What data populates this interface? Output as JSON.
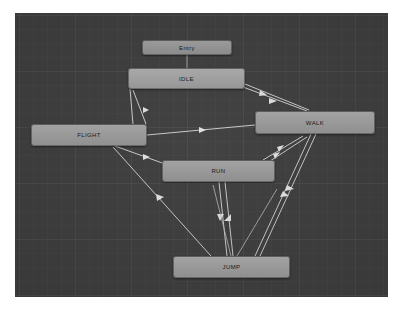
{
  "window": {
    "title": "Animator",
    "canvas_background_color": "#3f3f3f",
    "grid_color": "#4a4a4a"
  },
  "graph": {
    "type": "state-machine",
    "node_fill_color": "#9b9b9b",
    "transition_color": "#d8d8d8",
    "nodes": [
      {
        "id": "entry",
        "label": "Entry",
        "kind": "entry",
        "x": 127,
        "y": 27,
        "width": 90,
        "height": 15
      },
      {
        "id": "idle",
        "label": "IDLE",
        "kind": "default",
        "x": 113,
        "y": 55,
        "width": 117,
        "height": 21
      },
      {
        "id": "flight",
        "label": "FLIGHT",
        "kind": "state",
        "x": 16,
        "y": 111,
        "width": 116,
        "height": 22
      },
      {
        "id": "walk",
        "label": "WALK",
        "kind": "state",
        "x": 240,
        "y": 98,
        "width": 120,
        "height": 23
      },
      {
        "id": "run",
        "label": "RUN",
        "kind": "state",
        "x": 147,
        "y": 147,
        "width": 113,
        "height": 22
      },
      {
        "id": "jump",
        "label": "JUMP",
        "kind": "state",
        "x": 158,
        "y": 243,
        "width": 117,
        "height": 22
      }
    ],
    "transitions": [
      {
        "from": "entry",
        "to": "idle",
        "direction": "one-way"
      },
      {
        "from": "idle",
        "to": "flight",
        "direction": "one-way"
      },
      {
        "from": "idle",
        "to": "walk",
        "direction": "two-way"
      },
      {
        "from": "flight",
        "to": "walk",
        "direction": "one-way"
      },
      {
        "from": "flight",
        "to": "run",
        "direction": "one-way"
      },
      {
        "from": "flight",
        "to": "jump",
        "direction": "one-way"
      },
      {
        "from": "walk",
        "to": "run",
        "direction": "two-way"
      },
      {
        "from": "walk",
        "to": "jump",
        "direction": "two-way"
      },
      {
        "from": "run",
        "to": "jump",
        "direction": "two-way"
      }
    ]
  }
}
